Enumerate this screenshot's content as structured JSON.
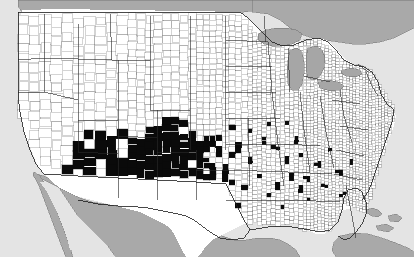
{
  "figure": {
    "subtitle": "",
    "caption": "",
    "width": 414,
    "height": 257
  },
  "colors": {
    "shaded_county": "#0a0a0a",
    "unshaded_county": "#ffffff",
    "county_border": "#3b3b3b",
    "state_border": "#2a2a2a",
    "national_border": "#1c1c1c",
    "foreign_land": "#a9a9a9",
    "water": "#e4e4e4",
    "lake": "#a6a6a6",
    "background": "#e3e3e3"
  },
  "chart_data": {
    "type": "map",
    "subtitle": "",
    "xlabel": "",
    "ylabel": "",
    "projection": "conic",
    "grid": false,
    "legend_position": "none",
    "categories": [
      "shaded",
      "unshaded"
    ],
    "series": [
      {
        "name": "shaded",
        "color": "#0a0a0a",
        "description": "Counties filled solid black, concentrated in the Southwest",
        "region_summary": [
          {
            "region": "Arizona",
            "coverage": "most counties shaded"
          },
          {
            "region": "New Mexico",
            "coverage": "most counties shaded"
          },
          {
            "region": "West Texas",
            "coverage": "dense block of shaded counties"
          },
          {
            "region": "Southeast California",
            "coverage": "southeastern counties shaded"
          },
          {
            "region": "Southern Nevada",
            "coverage": "southern tip shaded"
          },
          {
            "region": "Southern Colorado",
            "coverage": "southern counties shaded"
          },
          {
            "region": "Southwest Utah",
            "coverage": "a few southern counties shaded"
          },
          {
            "region": "Oklahoma panhandle",
            "coverage": "scattered shaded counties"
          },
          {
            "region": "Kansas",
            "coverage": "isolated shaded counties"
          },
          {
            "region": "South Texas",
            "coverage": "scattered shaded counties thinning toward coast"
          },
          {
            "region": "Gulf Coast / Southeast",
            "coverage": "isolated shaded counties"
          },
          {
            "region": "Atlantic Southeast",
            "coverage": "isolated shaded counties"
          }
        ]
      },
      {
        "name": "unshaded",
        "color": "#ffffff",
        "description": "Counties left white across the Northwest, Midwest, Northeast and Southeast"
      }
    ],
    "foreign_regions": [
      "Canada",
      "Mexico",
      "Bahamas",
      "Cuba"
    ],
    "water_bodies": [
      "Pacific Ocean",
      "Atlantic Ocean",
      "Gulf of Mexico",
      "Great Lakes"
    ]
  },
  "legend": {
    "visible": false,
    "entries": []
  },
  "axes": {
    "visible": false,
    "x_ticks": [],
    "y_ticks": []
  }
}
